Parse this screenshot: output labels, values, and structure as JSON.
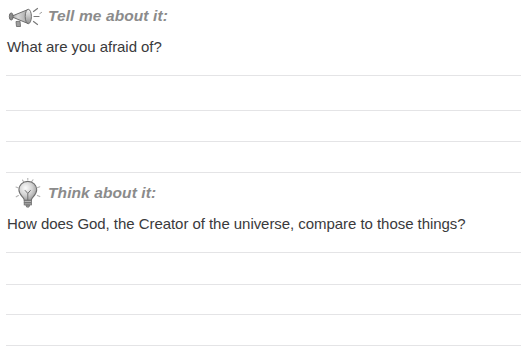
{
  "page": {
    "background_color": "#ffffff",
    "width": 527,
    "height": 355
  },
  "style": {
    "heading_color": "#8b8b8b",
    "question_color": "#3a3a3c",
    "rule_color": "#e4e4e6"
  },
  "sections": [
    {
      "id": "tell",
      "icon": "megaphone-icon",
      "label": "Tell me about it:",
      "question": "What are you afraid of?",
      "write_lines": 4
    },
    {
      "id": "think",
      "icon": "lightbulb-icon",
      "label": "Think about it:",
      "question": "How does God, the Creator of the universe, compare to those things?",
      "write_lines": 4
    }
  ]
}
